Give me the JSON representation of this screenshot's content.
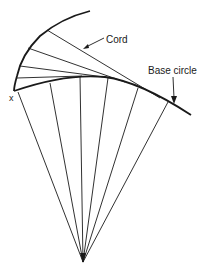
{
  "diagram": {
    "labels": {
      "cord": "Cord",
      "base_circle": "Base circle",
      "start_point": "x"
    },
    "colors": {
      "line": "#1a1a1a",
      "background": "#ffffff"
    },
    "apex": [
      83,
      262
    ],
    "involute_curve": [
      [
        90,
        11
      ],
      [
        70,
        17
      ],
      [
        47,
        30
      ],
      [
        34,
        40
      ],
      [
        28,
        48
      ],
      [
        22,
        58
      ],
      [
        20,
        66
      ],
      [
        18,
        72
      ],
      [
        17,
        78
      ],
      [
        15,
        86
      ],
      [
        14,
        91
      ]
    ],
    "base_circle_arc": [
      [
        14,
        91
      ],
      [
        40,
        84
      ],
      [
        80,
        76
      ],
      [
        110,
        78
      ],
      [
        140,
        89
      ],
      [
        170,
        103
      ],
      [
        191,
        115
      ]
    ],
    "chords": [
      {
        "from": [
          47,
          30
        ],
        "to": [
          150,
          94
        ]
      },
      {
        "from": [
          28,
          48
        ],
        "to": [
          120,
          81
        ]
      },
      {
        "from": [
          20,
          66
        ],
        "to": [
          110,
          78
        ]
      },
      {
        "from": [
          17,
          78
        ],
        "to": [
          80,
          76
        ]
      }
    ],
    "radials": [
      {
        "from": [
          83,
          262
        ],
        "to": [
          18,
          92
        ]
      },
      {
        "from": [
          83,
          262
        ],
        "to": [
          50,
          84
        ]
      },
      {
        "from": [
          83,
          262
        ],
        "to": [
          80,
          76
        ]
      },
      {
        "from": [
          83,
          262
        ],
        "to": [
          108,
          78
        ]
      },
      {
        "from": [
          83,
          262
        ],
        "to": [
          137,
          88
        ]
      },
      {
        "from": [
          83,
          262
        ],
        "to": [
          167,
          102
        ]
      }
    ]
  }
}
